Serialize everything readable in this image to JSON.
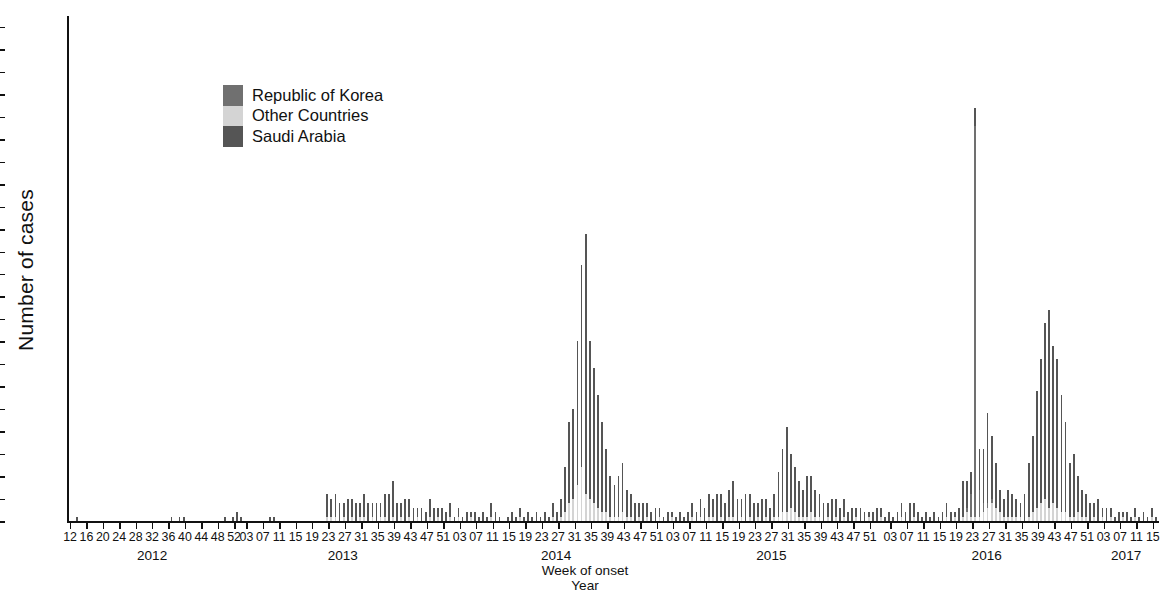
{
  "chart_data": {
    "type": "bar",
    "stacked": true,
    "title": "",
    "xlabel": "Week of onset",
    "xlabel2": "Year",
    "ylabel": "Number of cases",
    "ylim": [
      0,
      112
    ],
    "ytick_step": 5,
    "yticks": [
      0,
      5,
      10,
      15,
      20,
      25,
      30,
      35,
      40,
      45,
      50,
      55,
      60,
      65,
      70,
      75,
      80,
      85,
      90,
      95,
      100,
      105,
      110
    ],
    "grid": false,
    "legend_position": "inside-upper-left",
    "x_axis_note": "Epidemiologic week, labeled every 4 weeks",
    "x_start": {
      "year": 2012,
      "week": 12
    },
    "x_end": {
      "year": 2017,
      "week": 16
    },
    "years": [
      {
        "label": "2012",
        "first_week": 12,
        "last_week": 52
      },
      {
        "label": "2013",
        "first_week": 1,
        "last_week": 52
      },
      {
        "label": "2014",
        "first_week": 1,
        "last_week": 52
      },
      {
        "label": "2015",
        "first_week": 1,
        "last_week": 53
      },
      {
        "label": "2016",
        "first_week": 1,
        "last_week": 52
      },
      {
        "label": "2017",
        "first_week": 1,
        "last_week": 16
      }
    ],
    "week_tick_labels": [
      "12",
      "16",
      "20",
      "24",
      "28",
      "32",
      "36",
      "40",
      "44",
      "48",
      "52",
      "03",
      "07",
      "11",
      "15",
      "19",
      "23",
      "27",
      "31",
      "35",
      "39",
      "43",
      "47",
      "51",
      "03",
      "07",
      "11",
      "15",
      "19",
      "23",
      "27",
      "31",
      "35",
      "39",
      "43",
      "47",
      "51",
      "03",
      "07",
      "11",
      "15",
      "19",
      "23",
      "27",
      "31",
      "35",
      "39",
      "43",
      "47",
      "51",
      "03",
      "07",
      "11",
      "15",
      "19",
      "23",
      "27",
      "31",
      "35",
      "39",
      "43",
      "47",
      "51",
      "03",
      "07",
      "11",
      "15"
    ],
    "series": [
      {
        "name": "Saudi Arabia",
        "color": "#555555",
        "key": "saudi"
      },
      {
        "name": "Other Countries",
        "color": "#d4d4d4",
        "key": "other"
      },
      {
        "name": "Republic of Korea",
        "color": "#707070",
        "key": "korea"
      }
    ],
    "stack_order_bottom_to_top": [
      "other",
      "korea",
      "saudi"
    ],
    "values": {
      "saudi": [
        0,
        0,
        1,
        0,
        0,
        0,
        0,
        0,
        0,
        0,
        0,
        0,
        0,
        0,
        0,
        0,
        0,
        0,
        0,
        0,
        0,
        0,
        0,
        0,
        0,
        1,
        0,
        1,
        1,
        0,
        0,
        0,
        0,
        0,
        0,
        0,
        0,
        0,
        1,
        0,
        1,
        2,
        1,
        0,
        0,
        0,
        0,
        0,
        0,
        1,
        1,
        0,
        0,
        0,
        0,
        0,
        0,
        0,
        0,
        0,
        0,
        0,
        0,
        5,
        4,
        5,
        4,
        3,
        5,
        4,
        4,
        3,
        5,
        4,
        3,
        4,
        3,
        5,
        6,
        8,
        4,
        3,
        5,
        4,
        3,
        2,
        3,
        2,
        4,
        3,
        2,
        3,
        2,
        3,
        1,
        2,
        1,
        2,
        1,
        2,
        1,
        2,
        1,
        3,
        2,
        1,
        0,
        1,
        2,
        1,
        2,
        1,
        2,
        1,
        2,
        1,
        2,
        1,
        3,
        2,
        4,
        10,
        18,
        20,
        32,
        45,
        58,
        35,
        30,
        25,
        20,
        14,
        9,
        7,
        9,
        11,
        6,
        5,
        4,
        3,
        4,
        3,
        2,
        3,
        2,
        1,
        2,
        1,
        1,
        2,
        1,
        2,
        3,
        2,
        4,
        3,
        5,
        4,
        6,
        5,
        4,
        6,
        8,
        5,
        4,
        6,
        5,
        4,
        3,
        5,
        4,
        3,
        5,
        10,
        14,
        19,
        12,
        10,
        8,
        6,
        9,
        8,
        6,
        5,
        4,
        3,
        5,
        4,
        3,
        4,
        2,
        3,
        2,
        3,
        2,
        1,
        2,
        3,
        2,
        1,
        2,
        1,
        2,
        3,
        2,
        4,
        3,
        2,
        1,
        2,
        1,
        2,
        1,
        2,
        3,
        2,
        1,
        3,
        8,
        6,
        5,
        4,
        9,
        12,
        20,
        14,
        10,
        5,
        4,
        6,
        5,
        4,
        3,
        6,
        12,
        17,
        26,
        32,
        39,
        44,
        35,
        33,
        26,
        20,
        12,
        14,
        8,
        6,
        5,
        4,
        3,
        5,
        2,
        3,
        2,
        1,
        2,
        1,
        2,
        1,
        2,
        1,
        2,
        1,
        2,
        1,
        3,
        2,
        4,
        3,
        5,
        6,
        9,
        12,
        20,
        16,
        14,
        10,
        8,
        6,
        4,
        5,
        3,
        4,
        2,
        3,
        2,
        4,
        5,
        8,
        27,
        14,
        6,
        5,
        4,
        6,
        3,
        4,
        2,
        3,
        2,
        4,
        3,
        2,
        3,
        2,
        1,
        2,
        3,
        2,
        1,
        2,
        1,
        3,
        5,
        4,
        7,
        6,
        9,
        11,
        8,
        7,
        5,
        9,
        6,
        5,
        4,
        6,
        5,
        4,
        3,
        5,
        4,
        3,
        2,
        4,
        5,
        3,
        2,
        1,
        2
      ],
      "other": [
        0,
        0,
        0,
        0,
        0,
        0,
        0,
        0,
        0,
        0,
        0,
        0,
        0,
        0,
        0,
        0,
        0,
        0,
        0,
        0,
        0,
        0,
        0,
        0,
        0,
        0,
        0,
        0,
        0,
        0,
        0,
        0,
        0,
        0,
        0,
        0,
        0,
        0,
        0,
        0,
        0,
        0,
        0,
        0,
        0,
        0,
        0,
        0,
        0,
        0,
        0,
        0,
        0,
        0,
        0,
        0,
        0,
        0,
        0,
        0,
        0,
        0,
        0,
        1,
        1,
        1,
        0,
        1,
        0,
        1,
        0,
        1,
        1,
        0,
        1,
        0,
        1,
        1,
        0,
        1,
        0,
        1,
        0,
        1,
        0,
        1,
        0,
        0,
        1,
        0,
        1,
        0,
        0,
        1,
        0,
        1,
        0,
        0,
        1,
        0,
        0,
        0,
        0,
        1,
        0,
        0,
        0,
        0,
        0,
        0,
        1,
        0,
        0,
        0,
        0,
        0,
        0,
        0,
        1,
        0,
        1,
        2,
        4,
        5,
        8,
        12,
        6,
        5,
        4,
        3,
        2,
        2,
        1,
        1,
        1,
        2,
        1,
        1,
        0,
        1,
        0,
        1,
        0,
        0,
        1,
        0,
        0,
        1,
        0,
        0,
        0,
        0,
        1,
        0,
        1,
        0,
        1,
        1,
        0,
        1,
        0,
        1,
        1,
        0,
        1,
        0,
        1,
        0,
        1,
        0,
        1,
        0,
        1,
        1,
        2,
        2,
        3,
        2,
        1,
        1,
        1,
        2,
        1,
        1,
        0,
        1,
        0,
        1,
        0,
        1,
        0,
        0,
        1,
        0,
        0,
        1,
        0,
        0,
        1,
        0,
        0,
        0,
        0,
        1,
        0,
        0,
        1,
        0,
        0,
        0,
        0,
        0,
        0,
        0,
        1,
        0,
        1,
        0,
        1,
        2,
        1,
        1,
        1,
        2,
        3,
        4,
        3,
        2,
        1,
        1,
        1,
        1,
        1,
        0,
        1,
        2,
        3,
        4,
        5,
        3,
        4,
        3,
        2,
        2,
        1,
        1,
        2,
        1,
        1,
        0,
        1,
        0,
        1,
        0,
        1,
        0,
        0,
        1,
        0,
        0,
        1,
        0,
        0,
        0,
        1,
        0,
        0,
        1,
        0,
        1,
        1,
        1,
        2,
        2,
        3,
        2,
        2,
        1,
        1,
        1,
        1,
        1,
        0,
        1,
        0,
        1,
        0,
        1,
        1,
        2,
        2,
        3,
        2,
        1,
        1,
        1,
        0,
        1,
        0,
        1,
        0,
        1,
        0,
        1,
        1,
        0,
        1,
        0,
        0,
        1,
        0,
        1,
        0,
        0,
        1,
        1,
        1,
        1,
        2,
        1,
        2,
        2,
        1,
        1,
        1,
        2,
        1,
        1,
        1,
        1,
        1,
        1,
        0,
        1,
        1,
        0,
        0,
        1,
        1,
        0,
        0,
        0,
        0
      ],
      "korea": [
        0,
        0,
        0,
        0,
        0,
        0,
        0,
        0,
        0,
        0,
        0,
        0,
        0,
        0,
        0,
        0,
        0,
        0,
        0,
        0,
        0,
        0,
        0,
        0,
        0,
        0,
        0,
        0,
        0,
        0,
        0,
        0,
        0,
        0,
        0,
        0,
        0,
        0,
        0,
        0,
        0,
        0,
        0,
        0,
        0,
        0,
        0,
        0,
        0,
        0,
        0,
        0,
        0,
        0,
        0,
        0,
        0,
        0,
        0,
        0,
        0,
        0,
        0,
        0,
        0,
        0,
        0,
        0,
        0,
        0,
        0,
        0,
        0,
        0,
        0,
        0,
        0,
        0,
        0,
        0,
        0,
        0,
        0,
        0,
        0,
        0,
        0,
        0,
        0,
        0,
        0,
        0,
        0,
        0,
        0,
        0,
        0,
        0,
        0,
        0,
        0,
        0,
        0,
        0,
        0,
        0,
        0,
        0,
        0,
        0,
        0,
        0,
        0,
        0,
        0,
        0,
        0,
        0,
        0,
        0,
        0,
        0,
        0,
        0,
        0,
        0,
        0,
        0,
        0,
        0,
        0,
        0,
        0,
        0,
        0,
        0,
        0,
        0,
        0,
        0,
        0,
        0,
        0,
        0,
        0,
        0,
        0,
        0,
        0,
        0,
        0,
        0,
        0,
        0,
        0,
        0,
        0,
        0,
        0,
        0,
        0,
        0,
        0,
        0,
        0,
        0,
        0,
        0,
        0,
        0,
        0,
        0,
        0,
        0,
        0,
        0,
        0,
        0,
        0,
        0,
        0,
        0,
        0,
        0,
        0,
        0,
        0,
        0,
        0,
        0,
        0,
        0,
        0,
        0,
        0,
        0,
        0,
        0,
        0,
        0,
        0,
        0,
        0,
        0,
        0,
        0,
        0,
        0,
        0,
        0,
        0,
        0,
        0,
        0,
        0,
        0,
        0,
        0,
        0,
        0,
        0,
        0,
        0,
        0,
        0,
        0,
        0,
        0,
        0,
        0,
        0,
        0,
        0,
        0,
        0,
        0,
        0,
        0,
        0,
        0,
        0,
        0,
        0,
        0,
        0,
        0,
        0,
        0,
        0,
        0,
        0,
        0,
        0,
        0,
        0,
        0,
        0,
        0,
        0,
        0,
        0,
        0,
        0,
        0,
        0,
        0,
        0,
        0,
        0,
        0,
        0,
        0,
        0,
        0,
        0,
        0,
        0,
        0,
        0,
        0,
        0,
        0,
        0,
        0,
        0,
        0,
        0,
        0,
        0,
        0,
        0,
        0,
        0,
        0,
        0,
        0,
        0,
        0,
        0,
        0,
        0,
        0,
        0,
        0,
        0,
        0,
        0,
        0,
        0,
        0,
        0,
        0,
        0,
        0,
        0,
        0,
        0,
        0,
        0,
        0,
        0,
        0,
        0,
        0,
        0,
        0,
        0,
        0,
        0,
        0,
        0,
        0,
        0,
        0
      ],
      "korea_outbreak_note": "2015 Republic of Korea outbreak appears at weeks 20-26 of 2015",
      "korea_outbreak": {
        "start_index": 219,
        "values": [
          1,
          5,
          87,
          6,
          2,
          1,
          1
        ]
      }
    },
    "annotated_peaks": [
      {
        "label": "2014 Saudi Arabia peak",
        "value": 110
      },
      {
        "label": "2014 Saudi Arabia second peak",
        "value": 99
      },
      {
        "label": "2015 Republic of Korea peak",
        "value": 94
      },
      {
        "label": "2015 Saudi Arabia autumn peak",
        "value": 45
      },
      {
        "label": "2016 isolated spike",
        "value": 27
      }
    ]
  },
  "legend": {
    "items": [
      {
        "label": "Republic of Korea",
        "color": "#707070"
      },
      {
        "label": "Other Countries",
        "color": "#d4d4d4"
      },
      {
        "label": "Saudi Arabia",
        "color": "#555555"
      }
    ]
  },
  "axes": {
    "y_title": "Number of cases",
    "x_caption_line1": "Week of onset",
    "x_caption_line2": "Year"
  }
}
